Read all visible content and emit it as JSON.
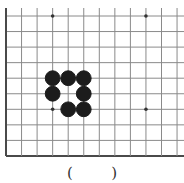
{
  "board": {
    "description": "Partial Go (weiqi) board, lower-left corner section",
    "grid": {
      "origin_x": 6,
      "origin_y": 16,
      "spacing": 15.55,
      "columns_visible": 12,
      "rows_visible": 10,
      "left_edge_is_border": true,
      "bottom_edge_is_border": true,
      "top_edge_open": true,
      "right_edge_open": true
    },
    "colors": {
      "line": "#8a8a8a",
      "border": "#4a4a4a",
      "black_stone": "#1c1c1c",
      "star_point": "#333333",
      "background": "#ffffff"
    },
    "star_points": [
      {
        "col": 3,
        "row": 0
      },
      {
        "col": 9,
        "row": 0
      },
      {
        "col": 3,
        "row": 6
      },
      {
        "col": 9,
        "row": 6
      }
    ],
    "stones": [
      {
        "color": "black",
        "col": 3,
        "row": 4
      },
      {
        "color": "black",
        "col": 4,
        "row": 4
      },
      {
        "color": "black",
        "col": 5,
        "row": 4
      },
      {
        "color": "black",
        "col": 3,
        "row": 5
      },
      {
        "color": "black",
        "col": 5,
        "row": 5
      },
      {
        "color": "black",
        "col": 4,
        "row": 6
      },
      {
        "color": "black",
        "col": 5,
        "row": 6
      }
    ]
  },
  "answer": {
    "open_paren": "(",
    "close_paren": ")"
  }
}
